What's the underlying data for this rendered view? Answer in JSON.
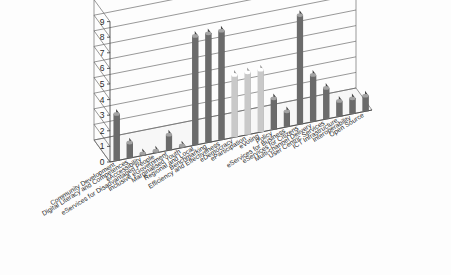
{
  "chart_data": {
    "type": "bar",
    "title": "",
    "subtitle": "",
    "xlabel": "",
    "ylabel": "",
    "ylim": [
      0,
      9
    ],
    "yticks": [
      "0",
      "1",
      "2",
      "3",
      "4",
      "5",
      "6",
      "7",
      "8",
      "9"
    ],
    "grid": true,
    "legend": "none",
    "three_d": true,
    "series_name": "",
    "categories": [
      "Community Development",
      "Digital Literacy and Competences",
      "eAccessibility",
      "eServices for Disadvantaged People",
      "Inclusive eGovernment",
      "Marginalised Youth",
      "Regional and Local",
      "Benchmarking",
      "Efficiency and Effectiveness",
      "eDemocracy",
      "eParticipation",
      "eVoting",
      "Policy",
      "eServices for Business",
      "eServices for Citizens",
      "Multi-channel Delivery",
      "User Centric Services",
      "ICT Infrastructure",
      "Interoperability",
      "Open Source"
    ],
    "values": [
      3,
      1,
      0,
      0,
      1,
      0,
      7,
      7,
      7,
      4,
      4,
      4,
      2,
      1,
      7,
      3,
      2,
      1,
      1,
      1
    ],
    "bar_colors": [
      "#6b6b6b",
      "#6b6b6b",
      "#6b6b6b",
      "#6b6b6b",
      "#6b6b6b",
      "#6b6b6b",
      "#6b6b6b",
      "#6b6b6b",
      "#6b6b6b",
      "#c9c9c9",
      "#c9c9c9",
      "#c9c9c9",
      "#6b6b6b",
      "#6b6b6b",
      "#6b6b6b",
      "#6b6b6b",
      "#6b6b6b",
      "#6b6b6b",
      "#6b6b6b",
      "#6b6b6b"
    ],
    "colors": {
      "bar_dark": "#6b6b6b",
      "bar_light": "#c9c9c9",
      "gridline": "#6d6d6d",
      "axis": "#4a4a4a",
      "background": "#fdfdfd",
      "text": "#1f1f1f"
    }
  }
}
